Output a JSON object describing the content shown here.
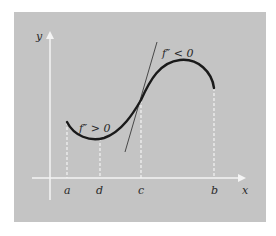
{
  "colors": {
    "page_background": "#ffffff",
    "panel_background": "#c4c4c4",
    "axis_color": "#f4f4f4",
    "dashed_guide_color": "#f4f4f4",
    "curve_color": "#1a1a1a",
    "tangent_color": "#3a3a3a",
    "text_color": "#2a2a2a"
  },
  "axes": {
    "x_label": "x",
    "y_label": "y"
  },
  "points": [
    {
      "label": "a",
      "x": 67
    },
    {
      "label": "d",
      "x": 100
    },
    {
      "label": "c",
      "x": 141
    },
    {
      "label": "b",
      "x": 214
    }
  ],
  "annotations": {
    "concave_up": "f″ > 0",
    "concave_down": "f″ < 0"
  },
  "figure": {
    "curve": "cubic-like S curve from a to b",
    "tangent_at": "c"
  }
}
